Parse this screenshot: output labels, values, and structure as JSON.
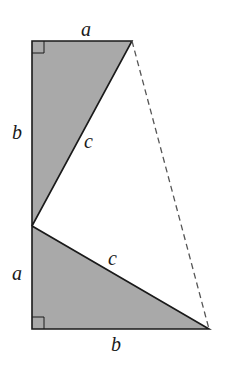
{
  "diagram": {
    "colors": {
      "fill": "#a9a9a9",
      "stroke": "#1a1a1a",
      "dashed": "#555555",
      "background": "#ffffff"
    },
    "points": {
      "top_left": [
        32,
        41
      ],
      "top_right": [
        132,
        41
      ],
      "mid_left": [
        32,
        226
      ],
      "bottom_left": [
        32,
        329
      ],
      "bottom_right": [
        209,
        329
      ]
    },
    "labels": {
      "top_a": "a",
      "left_b": "b",
      "upper_c": "c",
      "lower_a": "a",
      "lower_c": "c",
      "bottom_b": "b"
    }
  }
}
